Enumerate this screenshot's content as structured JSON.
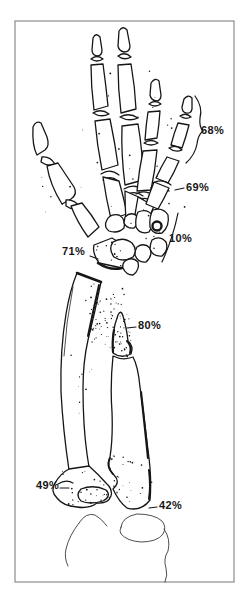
{
  "annotations": [
    {
      "id": "little-finger-phalanges",
      "value": "68%"
    },
    {
      "id": "finger-base",
      "value": "69%"
    },
    {
      "id": "carpal-bones",
      "value": "10%"
    },
    {
      "id": "distal-radius",
      "value": "71%"
    },
    {
      "id": "distal-ulna",
      "value": "80%"
    },
    {
      "id": "radial-head",
      "value": "49%"
    },
    {
      "id": "olecranon",
      "value": "42%"
    }
  ],
  "colors": {
    "ink": "#161616",
    "frame": "#8c8c8c",
    "background": "#ffffff"
  }
}
